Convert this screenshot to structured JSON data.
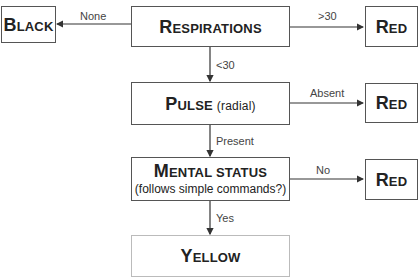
{
  "diagram": {
    "nodes": {
      "black": {
        "first": "B",
        "rest": "LACK"
      },
      "respirations": {
        "first": "R",
        "rest": "ESPIRATIONS"
      },
      "red_resp": {
        "first": "R",
        "rest": "ED"
      },
      "pulse": {
        "first": "P",
        "rest": "ULSE",
        "sub": "(radial)"
      },
      "red_pulse": {
        "first": "R",
        "rest": "ED"
      },
      "mental": {
        "first": "M",
        "rest": "ENTAL STATUS",
        "sub": "(follows simple commands?)"
      },
      "red_mental": {
        "first": "R",
        "rest": "ED"
      },
      "yellow": {
        "first": "Y",
        "rest": "ELLOW"
      }
    },
    "edges": {
      "resp_to_black": "None",
      "resp_to_red": ">30",
      "resp_to_pulse": "<30",
      "pulse_to_red": "Absent",
      "pulse_to_mental": "Present",
      "mental_to_red": "No",
      "mental_to_yellow": "Yes"
    },
    "colors": {
      "border": "#555555",
      "border_light": "#bbbbbb",
      "line": "#333333",
      "text": "#222222"
    }
  }
}
